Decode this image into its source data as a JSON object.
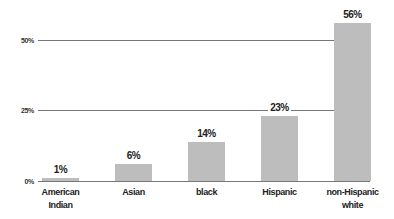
{
  "chart_data": {
    "type": "bar",
    "title": "",
    "xlabel": "",
    "ylabel": "",
    "categories": [
      "American Indian",
      "Asian",
      "black",
      "Hispanic",
      "non-Hispanic white"
    ],
    "category_lines": [
      [
        "American",
        "Indian"
      ],
      [
        "Asian"
      ],
      [
        "black"
      ],
      [
        "Hispanic"
      ],
      [
        "non-Hispanic",
        "white"
      ]
    ],
    "values": [
      1,
      6,
      14,
      23,
      56
    ],
    "value_labels": [
      "1%",
      "6%",
      "14%",
      "23%",
      "56%"
    ],
    "ylim": [
      0,
      60
    ],
    "yticks": [
      0,
      25,
      50
    ],
    "ytick_labels": [
      "0%",
      "25%",
      "50%"
    ],
    "grid": true,
    "legend": null,
    "bar_color": "#bdbdbd"
  }
}
